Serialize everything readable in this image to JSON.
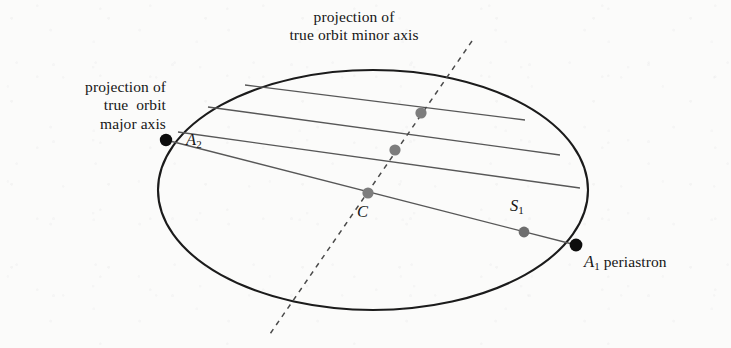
{
  "figure": {
    "kind": "astronomy-orbit-projection-diagram",
    "background_color": "#fbfbfa",
    "ink_color": "#161616"
  },
  "labels": {
    "major_axis_caption": "projection of\ntrue  orbit\nmajor axis",
    "minor_axis_caption": "projection of\ntrue orbit minor axis",
    "point_a2": "A",
    "point_a2_sub": "2",
    "point_center": "C",
    "point_s1": "S",
    "point_s1_sub": "1",
    "point_a1": "A",
    "point_a1_sub": "1",
    "point_a1_note": " periastron"
  },
  "geometry": {
    "ellipse": {
      "cx": 373,
      "cy": 190,
      "rx": 215,
      "ry": 120,
      "stroke": "#1b1b1b",
      "stroke_width": 2.1,
      "fill": "none"
    },
    "chords": [
      {
        "name": "chord-1",
        "x1": 245,
        "y1": 85,
        "x2": 525,
        "y2": 120
      },
      {
        "name": "chord-2",
        "x1": 208,
        "y1": 107,
        "x2": 560,
        "y2": 155
      },
      {
        "name": "chord-3",
        "x1": 178,
        "y1": 132,
        "x2": 580,
        "y2": 188
      },
      {
        "name": "chord-4-major",
        "x1": 166,
        "y1": 140,
        "x2": 576,
        "y2": 245
      }
    ],
    "chord_stroke": "#575757",
    "chord_stroke_width": 1.35,
    "minor_axis_line": {
      "name": "minor-axis-dashed",
      "x1": 472,
      "y1": 41,
      "x2": 270,
      "y2": 334,
      "stroke": "#4a4a4a",
      "stroke_width": 1.5,
      "dash": "5 5"
    },
    "points": [
      {
        "name": "point-a2",
        "x": 166,
        "y": 140,
        "r": 6.2,
        "color": "#0d0d0d",
        "kind": "apastron-node"
      },
      {
        "name": "point-a1",
        "x": 576,
        "y": 245,
        "r": 6.4,
        "color": "#0d0d0d",
        "kind": "periastron-node"
      },
      {
        "name": "point-center",
        "x": 368,
        "y": 193,
        "r": 5.6,
        "color": "#7d7d7d",
        "kind": "chord-midpoint"
      },
      {
        "name": "point-s1",
        "x": 524,
        "y": 232,
        "r": 5.4,
        "color": "#6e6e6e",
        "kind": "focus-primary"
      },
      {
        "name": "point-mid-2",
        "x": 395,
        "y": 150,
        "r": 5.6,
        "color": "#7d7d7d",
        "kind": "chord-midpoint"
      },
      {
        "name": "point-mid-1",
        "x": 421,
        "y": 113,
        "r": 5.6,
        "color": "#7d7d7d",
        "kind": "chord-midpoint"
      }
    ]
  }
}
